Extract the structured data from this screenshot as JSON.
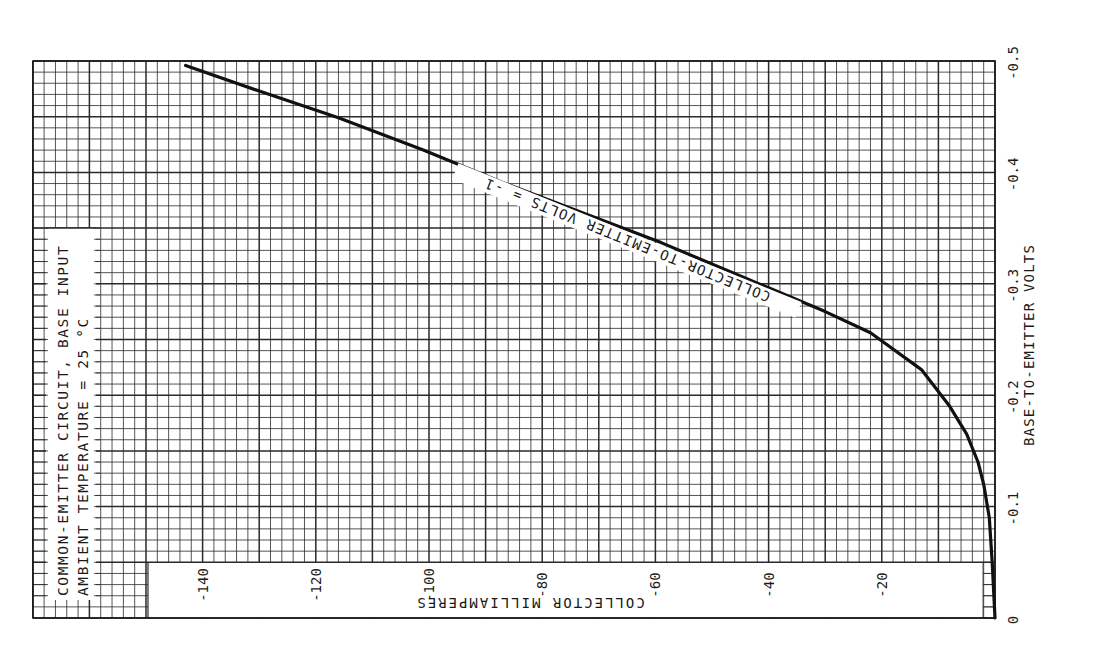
{
  "chart_data": {
    "type": "line",
    "orientation": "page rotated 90° counter-clockwise",
    "title_lines": [
      "COMMON-EMITTER CIRCUIT, BASE INPUT",
      "AMBIENT TEMPERATURE = 25 °C"
    ],
    "xlabel": "COLLECTOR MILLIAMPERES",
    "ylabel": "BASE-TO-EMITTER VOLTS",
    "xlim": [
      -170,
      0
    ],
    "ylim": [
      -0.5,
      0
    ],
    "x_ticks": [
      {
        "value": -140,
        "label": "-140"
      },
      {
        "value": -120,
        "label": "-120"
      },
      {
        "value": -100,
        "label": "-100"
      },
      {
        "value": -80,
        "label": "-80"
      },
      {
        "value": -60,
        "label": "-60"
      },
      {
        "value": -40,
        "label": "-40"
      },
      {
        "value": -20,
        "label": "-20"
      }
    ],
    "y_ticks": [
      {
        "value": 0,
        "label": "0"
      },
      {
        "value": -0.1,
        "label": "-0.1"
      },
      {
        "value": -0.2,
        "label": "-0.2"
      },
      {
        "value": -0.3,
        "label": "-0.3"
      },
      {
        "value": -0.4,
        "label": "-0.4"
      },
      {
        "value": -0.5,
        "label": "-0.5"
      }
    ],
    "grid": {
      "major_x": 10,
      "minor_x": 2,
      "major_y": 0.05,
      "minor_y": 0.01
    },
    "series": [
      {
        "name": "COLLECTOR-TO-EMITTER VOLTS = -1",
        "x": [
          0,
          -0.5,
          -1,
          -2,
          -3,
          -5,
          -8,
          -13,
          -22,
          -30,
          -45,
          -59,
          -73,
          -87,
          -101,
          -116,
          -130,
          -143
        ],
        "y": [
          0,
          -0.05,
          -0.09,
          -0.12,
          -0.14,
          -0.165,
          -0.19,
          -0.223,
          -0.256,
          -0.275,
          -0.307,
          -0.337,
          -0.364,
          -0.391,
          -0.42,
          -0.449,
          -0.473,
          -0.496
        ]
      }
    ],
    "annotations": [
      {
        "text": "COLLECTOR-TO-EMITTER VOLTS = -1",
        "placement": "along curve"
      }
    ]
  },
  "colors": {
    "grid": "#2a2a2a",
    "curve": "#111111",
    "background": "#ffffff"
  }
}
